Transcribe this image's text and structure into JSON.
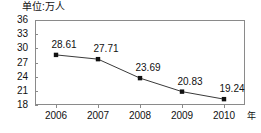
{
  "chart_data": {
    "type": "line",
    "title": "",
    "unit_caption": "单位:万人",
    "xlabel": "年",
    "ylabel": "",
    "categories": [
      "2006",
      "2007",
      "2008",
      "2009",
      "2010"
    ],
    "values": [
      28.61,
      27.71,
      23.69,
      20.83,
      19.24
    ],
    "data_labels": [
      "28.61",
      "27.71",
      "23.69",
      "20.83",
      "19.24"
    ],
    "yticks": [
      "36",
      "33",
      "30",
      "27",
      "24",
      "21",
      "18"
    ],
    "ylim": [
      18,
      36
    ],
    "grid": false,
    "legend": "none",
    "marker": "square",
    "line_color": "#3a3a3a",
    "marker_color": "#111111",
    "axis_color": "#8a8a8a",
    "text_color": "#111111",
    "background": "#ffffff"
  }
}
